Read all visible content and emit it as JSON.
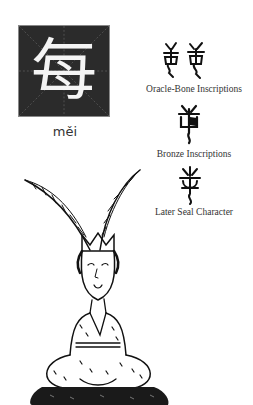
{
  "main_character": {
    "hanzi": "每",
    "pinyin": "měi"
  },
  "scripts": [
    {
      "label": "Oracle-Bone Inscriptions",
      "icon": "oracle-bone-glyph-icon"
    },
    {
      "label": "Bronze Inscriptions",
      "icon": "bronze-glyph-icon"
    },
    {
      "label": "Later Seal Character",
      "icon": "seal-glyph-icon"
    }
  ],
  "illustration": {
    "icon": "seated-woman-with-feather-headdress-illustration"
  },
  "colors": {
    "box_background": "#2b2b2b",
    "glyph_color": "#f4f4f4",
    "ink": "#222222"
  }
}
